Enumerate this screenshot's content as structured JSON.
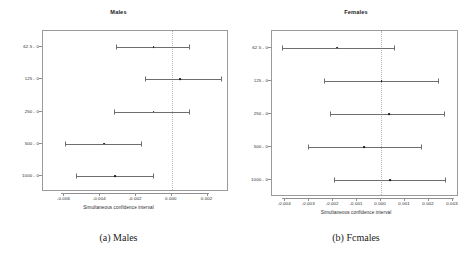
{
  "figure": {
    "caption_a": "(a) Males",
    "caption_b": "(b) Fcmales"
  },
  "chart_data": [
    {
      "type": "scatter",
      "id": "males",
      "title": "Males",
      "xlabel": "Simultaneous confidence interval",
      "ylabel": "",
      "orientation": "horizontal",
      "grid": false,
      "reference_line": 0.0,
      "xlim": [
        -0.0072,
        0.0032
      ],
      "xticks": [
        -0.006,
        -0.004,
        -0.002,
        0.0,
        0.002
      ],
      "xticklabels": [
        "-0.006",
        "-0.004",
        "-0.002",
        "0.000",
        "0.002"
      ],
      "categories": [
        "62.5 - 0",
        "125 - 0",
        "250 - 0",
        "500 - 0",
        "1000 - 0"
      ],
      "estimates": [
        -0.00102,
        0.00048,
        -0.00102,
        -0.00378,
        -0.00318
      ],
      "lower": [
        -0.00312,
        -0.00152,
        -0.00322,
        -0.00598,
        -0.00533
      ],
      "upper": [
        0.00098,
        0.00275,
        0.00098,
        -0.00172,
        -0.00105
      ]
    },
    {
      "type": "scatter",
      "id": "females",
      "title": "Females",
      "xlabel": "Simultaneous confidence interval",
      "ylabel": "",
      "orientation": "horizontal",
      "grid": false,
      "reference_line": 0.0,
      "xlim": [
        -0.00455,
        0.00325
      ],
      "xticks": [
        -0.004,
        -0.003,
        -0.002,
        -0.001,
        0.0,
        0.001,
        0.002,
        0.003
      ],
      "xticklabels": [
        "-0.004",
        "-0.003",
        "-0.002",
        "-0.001",
        "0.000",
        "0.001",
        "0.002",
        "0.003"
      ],
      "categories": [
        "62.5 - 0",
        "125 - 0",
        "250 - 0",
        "500 - 0",
        "1000 - 0"
      ],
      "estimates": [
        -0.00182,
        2e-05,
        0.00032,
        -0.00072,
        0.00038
      ],
      "lower": [
        -0.00412,
        -0.00237,
        -0.00215,
        -0.00305,
        -0.00198
      ],
      "upper": [
        0.00055,
        0.00238,
        0.00262,
        0.00165,
        0.00268
      ]
    }
  ]
}
